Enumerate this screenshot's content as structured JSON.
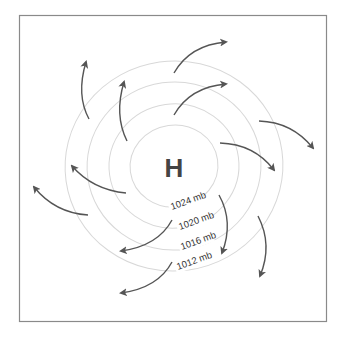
{
  "center": {
    "symbol": "H",
    "meaning": "high pressure"
  },
  "isobars": [
    {
      "label": "1024 mb",
      "pressure_mb": 1024
    },
    {
      "label": "1020 mb",
      "pressure_mb": 1020
    },
    {
      "label": "1016 mb",
      "pressure_mb": 1016
    },
    {
      "label": "1012 mb",
      "pressure_mb": 1012
    }
  ],
  "wind_flow": {
    "direction": "clockwise, outward",
    "arrow_count": 12
  },
  "colors": {
    "isobar": "#d8d8d8",
    "arrow": "#555555",
    "text": "#444444",
    "frame": "#8a8a8a"
  }
}
